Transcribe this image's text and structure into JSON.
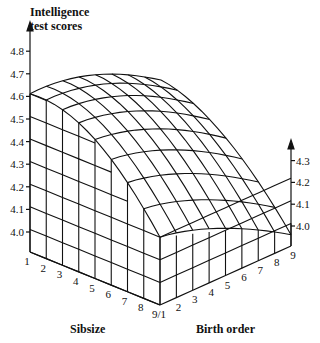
{
  "chart_data": {
    "type": "surface3d",
    "title": "",
    "zlabel": "Intelligence test scores",
    "xlabel": "Sibsize",
    "ylabel": "Birth order",
    "z_ticks_left": [
      "4.0",
      "4.1",
      "4.2",
      "4.3",
      "4.4",
      "4.5",
      "4.6",
      "4.7",
      "4.8"
    ],
    "z_ticks_right": [
      "4.0",
      "4.1",
      "4.2",
      "4.3"
    ],
    "sibsize_ticks": [
      "1",
      "2",
      "3",
      "4",
      "5",
      "6",
      "7",
      "8",
      "9/1"
    ],
    "birth_order_ticks": [
      "2",
      "3",
      "4",
      "5",
      "6",
      "7",
      "8",
      "9"
    ],
    "zlim": [
      4.0,
      4.8
    ],
    "sibsize": [
      1,
      2,
      3,
      4,
      5,
      6,
      7,
      8,
      9
    ],
    "birth_order": [
      1,
      2,
      3,
      4,
      5,
      6,
      7,
      8,
      9
    ],
    "surface_note": "Score declines with larger sibsize and later birth order; sibsize=1 birth order=1 ≈ 4.70; sibsize=9 birth order=9 ≈ 4.10",
    "front_edge_birth_order_1": [
      4.7,
      4.68,
      4.66,
      4.63,
      4.58,
      4.52,
      4.45,
      4.38,
      4.3
    ],
    "right_edge_sibsize_9": [
      4.3,
      4.29,
      4.28,
      4.26,
      4.24,
      4.21,
      4.18,
      4.14,
      4.1
    ],
    "grid": true
  },
  "labels": {
    "z_title_line1": "Intelligence",
    "z_title_line2": "test scores",
    "sibsize": "Sibsize",
    "birth_order": "Birth order"
  }
}
